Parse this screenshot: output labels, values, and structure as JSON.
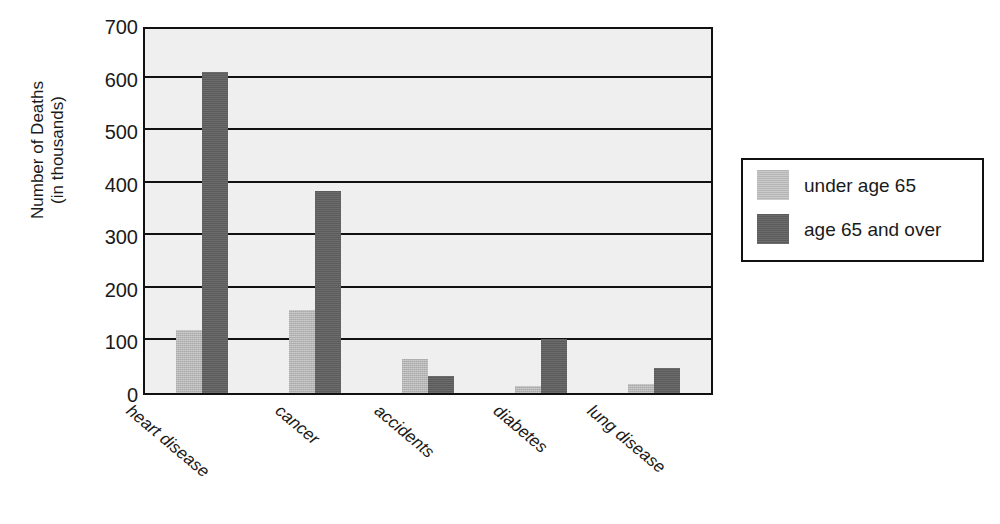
{
  "chart_data": {
    "type": "bar",
    "title": "",
    "xlabel": "",
    "ylabel": "Number of Deaths\n(in thousands)",
    "ylabel_line1": "Number of Deaths",
    "ylabel_line2": "(in thousands)",
    "categories": [
      "heart disease",
      "cancer",
      "accidents",
      "diabetes",
      "lung disease"
    ],
    "series": [
      {
        "name": "under age 65",
        "color": "#b4b4b4",
        "values": [
          120,
          157,
          65,
          13,
          18
        ]
      },
      {
        "name": "age 65 and over",
        "color": "#5b5b5b",
        "values": [
          610,
          385,
          33,
          103,
          47
        ]
      }
    ],
    "ylim": [
      0,
      700
    ],
    "ytick_values": [
      700,
      600,
      500,
      400,
      300,
      200,
      100,
      0
    ],
    "ytick_labels": [
      "700",
      "600",
      "500",
      "400",
      "300",
      "200",
      "100",
      "0"
    ],
    "gridlines": [
      600,
      500,
      400,
      300,
      200,
      100
    ],
    "grid": true,
    "legend_position": "right",
    "plot_background": "#efefef",
    "axis_color": "#111111"
  },
  "legend": {
    "entries": [
      {
        "label": "under age 65",
        "swatch": "under"
      },
      {
        "label": "age 65 and over",
        "swatch": "over"
      }
    ]
  }
}
